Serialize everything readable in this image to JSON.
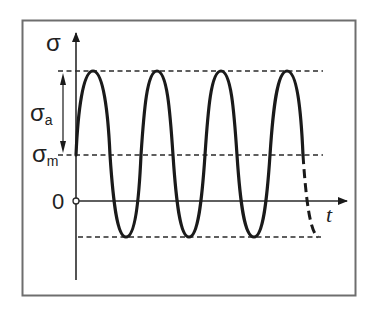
{
  "diagram": {
    "type": "cyclic stress vs time",
    "colors": {
      "frame": "#6e6e6e",
      "curve": "#1a1a1a",
      "axis": "#2a2a2a",
      "dashed": "#2a2a2a",
      "background": "#ffffff"
    },
    "labels": {
      "y_axis": "σ",
      "x_axis": "t",
      "amplitude_main": "σ",
      "amplitude_sub": "a",
      "mean_main": "σ",
      "mean_sub": "m",
      "origin": "0"
    },
    "reference_lines": [
      {
        "name": "max-stress-line",
        "level": "σm + σa"
      },
      {
        "name": "mean-stress-line",
        "level": "σm"
      },
      {
        "name": "min-stress-line",
        "level": "σm - σa"
      }
    ],
    "waveform": {
      "shape": "sinusoid",
      "full_cycles_shown": 3.5,
      "peaks": 4,
      "last_segment_style": "dashed"
    }
  }
}
